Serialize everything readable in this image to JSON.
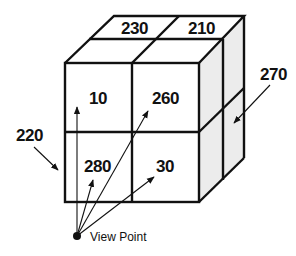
{
  "diagram": {
    "type": "3d-cube-grid",
    "front_face": {
      "cells": [
        {
          "label": "10",
          "row": 0,
          "col": 0
        },
        {
          "label": "260",
          "row": 0,
          "col": 1
        },
        {
          "label": "280",
          "row": 1,
          "col": 0
        },
        {
          "label": "30",
          "row": 1,
          "col": 1
        }
      ]
    },
    "top_face": {
      "cells": [
        {
          "label": "230",
          "col": 0
        },
        {
          "label": "210",
          "col": 1
        }
      ]
    },
    "callouts": [
      {
        "label": "220",
        "target": "left-edge-of-cube"
      },
      {
        "label": "270",
        "target": "right-side-face"
      }
    ],
    "view_point": {
      "label": "View Point"
    },
    "colors": {
      "line": "#111111",
      "side_shade": "#ececec",
      "background": "#ffffff"
    }
  }
}
